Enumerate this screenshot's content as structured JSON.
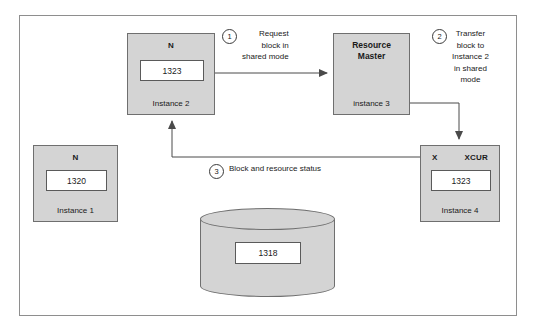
{
  "diagram": {
    "frame_border_color": "#8e8e8e",
    "node_fill_color": "#d4d4d4",
    "node_border_color": "#6f6f6f"
  },
  "nodes": {
    "instance2": {
      "top_label": "N",
      "value": "1323",
      "bottom_label": "Instance 2"
    },
    "resource_master": {
      "title": "Resource\nMaster",
      "bottom_label": "instance 3"
    },
    "instance1": {
      "top_label": "N",
      "value": "1320",
      "bottom_label": "Instance 1"
    },
    "instance4": {
      "top_label_left": "X",
      "top_label_right": "XCUR",
      "value": "1323",
      "bottom_label": "Instance 4"
    },
    "database": {
      "value": "1318"
    }
  },
  "steps": [
    {
      "number": "1",
      "text": "Request\nblock in\nshared mode"
    },
    {
      "number": "2",
      "text": "Transfer\nblock to\nInstance 2\nin shared\nmode"
    },
    {
      "number": "3",
      "text": "Block and resource status"
    }
  ]
}
